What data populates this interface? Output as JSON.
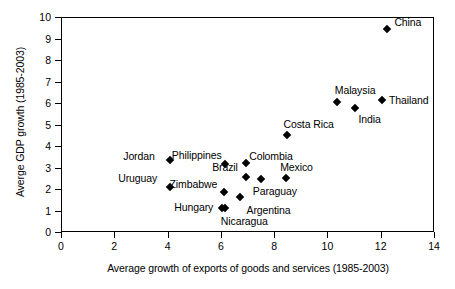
{
  "chart_data": {
    "type": "scatter",
    "title": "",
    "xlabel": "Average growth of exports of goods and services (1985-2003)",
    "ylabel": "Averge GDP growth (1985-2003)",
    "xlim": [
      0,
      14
    ],
    "ylim": [
      0,
      10
    ],
    "xticks": [
      0,
      2,
      4,
      6,
      8,
      10,
      12,
      14
    ],
    "yticks": [
      0,
      1,
      2,
      3,
      4,
      5,
      6,
      7,
      8,
      9,
      10
    ],
    "grid": false,
    "legend": "none",
    "marker_shape": "filled-diamond",
    "marker_color": "#000000",
    "points": [
      {
        "name": "China",
        "x": 12.25,
        "y": 9.45,
        "label_dx": 7,
        "label_dy": -7
      },
      {
        "name": "Thailand",
        "x": 12.05,
        "y": 6.15,
        "label_dx": 7,
        "label_dy": 0
      },
      {
        "name": "Malaysia",
        "x": 10.35,
        "y": 6.05,
        "label_dx": -2,
        "label_dy": -12
      },
      {
        "name": "India",
        "x": 11.05,
        "y": 5.75,
        "label_dx": 3,
        "label_dy": 11
      },
      {
        "name": "Costa Rica",
        "x": 8.5,
        "y": 4.5,
        "label_dx": -4,
        "label_dy": -11
      },
      {
        "name": "Jordan",
        "x": 4.1,
        "y": 3.35,
        "label_dx": -47,
        "label_dy": -4
      },
      {
        "name": "Philippines",
        "x": 6.15,
        "y": 3.15,
        "label_dx": -53,
        "label_dy": -9
      },
      {
        "name": "Colombia",
        "x": 6.95,
        "y": 3.2,
        "label_dx": 3,
        "label_dy": -7
      },
      {
        "name": "Brazil",
        "x": 6.95,
        "y": 2.55,
        "label_dx": -34,
        "label_dy": -10
      },
      {
        "name": "Mexico",
        "x": 8.45,
        "y": 2.5,
        "label_dx": -6,
        "label_dy": -11
      },
      {
        "name": "Paraguay",
        "x": 7.5,
        "y": 2.45,
        "label_dx": -8,
        "label_dy": 12
      },
      {
        "name": "Uruguay",
        "x": 4.1,
        "y": 2.1,
        "label_dx": -52,
        "label_dy": -9
      },
      {
        "name": "Zimbabwe",
        "x": 6.1,
        "y": 1.85,
        "label_dx": -54,
        "label_dy": -8
      },
      {
        "name": "Argentina",
        "x": 6.7,
        "y": 1.65,
        "label_dx": 7,
        "label_dy": 13
      },
      {
        "name": "Hungary",
        "x": 6.05,
        "y": 1.1,
        "label_dx": -48,
        "label_dy": -1
      },
      {
        "name": "Nicaragua",
        "x": 6.15,
        "y": 1.1,
        "label_dx": -4,
        "label_dy": 13
      }
    ]
  },
  "axes": {
    "x_title": "Average growth of exports of goods and services (1985-2003)",
    "y_title": "Averge GDP growth (1985-2003)",
    "x_tick_labels": [
      "0",
      "2",
      "4",
      "6",
      "8",
      "10",
      "12",
      "14"
    ],
    "y_tick_labels": [
      "0",
      "1",
      "2",
      "3",
      "4",
      "5",
      "6",
      "7",
      "8",
      "9",
      "10"
    ]
  }
}
